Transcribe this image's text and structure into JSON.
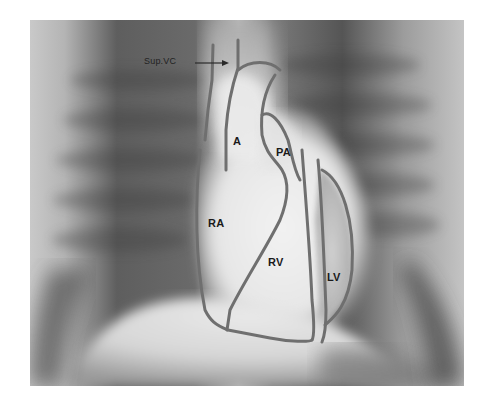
{
  "figure": {
    "type": "chest-xray-heart-diagram",
    "annotation_color": "#6f6f6f",
    "labels": {
      "sup_vc": "Sup.VC",
      "aorta": "A",
      "pulmonary_artery": "PA",
      "right_atrium": "RA",
      "right_ventricle": "RV",
      "left_ventricle": "LV"
    }
  }
}
